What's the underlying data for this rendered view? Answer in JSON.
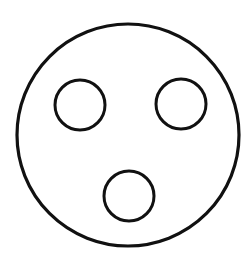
{
  "diagram": {
    "stroke_color": "#111111",
    "background_color": "#ffffff",
    "outer_circle": {
      "cx": 128,
      "cy": 135,
      "r": 111,
      "stroke_width": 3.2
    },
    "inner_circles": [
      {
        "name": "upper-left",
        "cx": 80,
        "cy": 105,
        "r": 25,
        "stroke_width": 3
      },
      {
        "name": "upper-right",
        "cx": 181,
        "cy": 104,
        "r": 25,
        "stroke_width": 3
      },
      {
        "name": "bottom-center",
        "cx": 129,
        "cy": 196,
        "r": 25,
        "stroke_width": 3
      }
    ]
  }
}
